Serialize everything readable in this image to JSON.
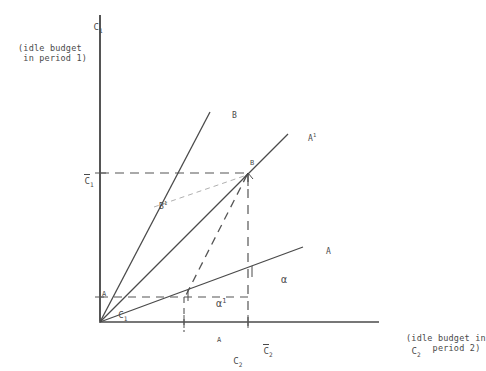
{
  "figure": {
    "type": "line-diagram",
    "background": "#ffffff",
    "ink": "#4a4a4a"
  },
  "axes": {
    "y": {
      "name": "C",
      "name_sub": "1",
      "description": "(idle budget\n in period 1)",
      "origin_px": [
        100,
        322
      ],
      "top_px": [
        100,
        16
      ]
    },
    "x": {
      "name": "C",
      "name_sub": "2",
      "description": "(idle budget in\n     period 2)",
      "origin_px": [
        100,
        322
      ],
      "right_px": [
        378,
        322
      ]
    }
  },
  "ticks": {
    "y": [
      {
        "id": "c1-bar",
        "base": "C",
        "sub": "1",
        "overbar": true,
        "sup": "",
        "value_px": 173
      },
      {
        "id": "c1-A",
        "base": "C",
        "sub": "1",
        "overbar": false,
        "sup": "A",
        "value_px": 297
      }
    ],
    "x": [
      {
        "id": "c2-A",
        "base": "C",
        "sub": "2",
        "overbar": false,
        "sup": "A",
        "value_px": 184
      },
      {
        "id": "c2-bar",
        "base": "C",
        "sub": "2",
        "overbar": true,
        "sup": "",
        "value_px": 248
      }
    ]
  },
  "rays": [
    {
      "id": "ray-B",
      "label": "B",
      "label_sup": "",
      "from_px": [
        100,
        322
      ],
      "to_px": [
        210,
        112
      ],
      "label_px": [
        212,
        105
      ]
    },
    {
      "id": "ray-A1",
      "label": "A",
      "label_sup": "1",
      "from_px": [
        100,
        322
      ],
      "to_px": [
        288,
        134
      ],
      "label_px": [
        289,
        128
      ]
    },
    {
      "id": "ray-A",
      "label": "A",
      "label_sup": "",
      "from_px": [
        100,
        322
      ],
      "to_px": [
        303,
        247
      ],
      "label_px": [
        306,
        241
      ]
    }
  ],
  "points": [
    {
      "id": "point-B",
      "label": "B",
      "px": [
        248,
        173
      ],
      "label_px": [
        250,
        163
      ]
    }
  ],
  "annotations": [
    {
      "id": "label-B1",
      "label": "B",
      "sup": "1",
      "px": [
        140,
        196
      ]
    }
  ],
  "angles": [
    {
      "id": "angle-alpha",
      "label": "α",
      "sup": "",
      "px": [
        259,
        266
      ],
      "vertex_px": [
        248,
        276
      ]
    },
    {
      "id": "angle-alpha-one",
      "label": "α",
      "sup": "1",
      "px": [
        184,
        290
      ],
      "vertex_px": [
        184,
        299
      ]
    }
  ],
  "dashed": {
    "h_c1_bar": {
      "from_px": [
        100,
        173
      ],
      "to_px": [
        248,
        173
      ]
    },
    "h_c1_A": {
      "from_px": [
        100,
        297
      ],
      "to_px": [
        248,
        297
      ]
    },
    "v_c2_bar": {
      "from_px": [
        248,
        173
      ],
      "to_px": [
        248,
        330
      ]
    },
    "v_c2_A": {
      "from_px": [
        184,
        297
      ],
      "to_px": [
        184,
        330
      ]
    },
    "chord_B_to_alpha1": {
      "from_px": [
        248,
        173
      ],
      "to_px": [
        184,
        297
      ]
    },
    "thin_B1_to_B": {
      "from_px": [
        155,
        206
      ],
      "to_px": [
        248,
        173
      ]
    }
  }
}
